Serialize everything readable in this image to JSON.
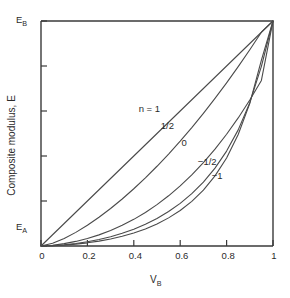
{
  "chart_data": {
    "type": "line",
    "title": "",
    "xlabel": "V_B",
    "xlabel_base": "V",
    "xlabel_sub": "B",
    "ylabel": "Composite modulus, E",
    "xlim": [
      0,
      1
    ],
    "ylim": [
      0,
      1
    ],
    "grid": false,
    "legend_position": "inline-annotations",
    "x_ticks": [
      0,
      0.2,
      0.4,
      0.6,
      0.8,
      1
    ],
    "x_tick_labels": [
      "0",
      "0.2",
      "0.4",
      "0.6",
      "0.8",
      "1"
    ],
    "y_tick_values": [
      0,
      0.2,
      0.4,
      0.6,
      0.8,
      1
    ],
    "y_tick_labels": [
      "",
      "",
      "",
      "",
      "",
      ""
    ],
    "y_axis_endpoint_labels": {
      "bottom_base": "E",
      "bottom_sub": "A",
      "bottom_value": 0,
      "top_base": "E",
      "top_sub": "B",
      "top_value": 1
    },
    "x": [
      0,
      0.05,
      0.1,
      0.15,
      0.2,
      0.25,
      0.3,
      0.35,
      0.4,
      0.45,
      0.5,
      0.55,
      0.6,
      0.65,
      0.7,
      0.75,
      0.8,
      0.85,
      0.9,
      0.95,
      1
    ],
    "series": [
      {
        "name": "n = 1",
        "label": "n = 1",
        "n": 1,
        "label_x": 0.49,
        "label_y": 0.61,
        "values": [
          0,
          0.05,
          0.1,
          0.15,
          0.2,
          0.25,
          0.3,
          0.35,
          0.4,
          0.45,
          0.5,
          0.55,
          0.6,
          0.65,
          0.7,
          0.75,
          0.8,
          0.85,
          0.9,
          0.95,
          1
        ]
      },
      {
        "name": "1/2",
        "label": "1/2",
        "n": 0.5,
        "label_x": 0.585,
        "label_y": 0.535,
        "values": [
          0,
          0.0125,
          0.0336,
          0.0606,
          0.0922,
          0.1276,
          0.1667,
          0.2089,
          0.2544,
          0.3029,
          0.3544,
          0.4088,
          0.4662,
          0.5265,
          0.5898,
          0.6559,
          0.7251,
          0.7972,
          0.8722,
          0.9503,
          1
        ]
      },
      {
        "name": "0",
        "label": "0",
        "n": 0,
        "label_x": 0.675,
        "label_y": 0.458,
        "values": [
          0,
          0.0035,
          0.0105,
          0.0204,
          0.0333,
          0.0494,
          0.0688,
          0.0918,
          0.1184,
          0.149,
          0.1838,
          0.2231,
          0.267,
          0.3161,
          0.3704,
          0.4305,
          0.4966,
          0.5692,
          0.6488,
          0.7357,
          1
        ]
      },
      {
        "name": "-1/2",
        "label": "−1/2",
        "n": -0.5,
        "label_x": 0.745,
        "label_y": 0.372,
        "values": [
          0,
          0.0018,
          0.0056,
          0.0113,
          0.019,
          0.029,
          0.0414,
          0.0566,
          0.0749,
          0.0967,
          0.1226,
          0.1533,
          0.1896,
          0.2327,
          0.2842,
          0.3462,
          0.4219,
          0.5161,
          0.6369,
          0.7986,
          1
        ]
      },
      {
        "name": "-1",
        "label": "−1",
        "n": -1,
        "label_x": 0.805,
        "label_y": 0.31,
        "values": [
          0,
          0.0013,
          0.004,
          0.0083,
          0.0141,
          0.0217,
          0.0313,
          0.0432,
          0.0579,
          0.0759,
          0.098,
          0.125,
          0.1579,
          0.1985,
          0.2486,
          0.3115,
          0.3913,
          0.4953,
          0.6338,
          0.8264,
          1
        ]
      }
    ]
  }
}
